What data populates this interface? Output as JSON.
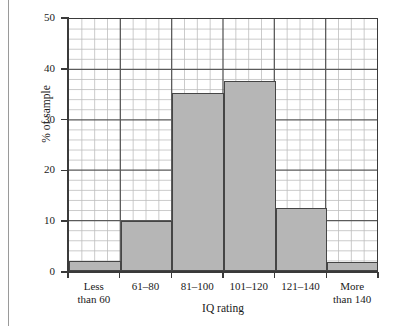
{
  "chart_data": {
    "type": "bar",
    "title": "",
    "subtitle": "",
    "xlabel": "IQ rating",
    "ylabel": "% of sample",
    "categories": [
      "Less\nthan 60",
      "61–80",
      "81–100",
      "101–120",
      "121–140",
      "More\nthan 140"
    ],
    "values": [
      2,
      9.8,
      35,
      37.5,
      12.5,
      1.7
    ],
    "ylim": [
      0,
      50
    ],
    "yticks": [
      0,
      10,
      20,
      30,
      40,
      50
    ],
    "ytick_labels": [
      "0",
      "10",
      "20",
      "30",
      "40",
      "50"
    ],
    "grid": true,
    "grid_minor_y_step": 2,
    "grid_minor_x_per_category": 4,
    "legend": "none",
    "annotations": [],
    "colors": {
      "bar_fill": "#b6b6b6",
      "bar_edge": "#454545",
      "axis": "#3a3a3a",
      "grid_major": "#5a5a5a",
      "grid_minor": "#bdbdbd",
      "text": "#1a1a1a",
      "background": "#ffffff"
    }
  },
  "figure": {
    "ytitle": "% of sample",
    "xtitle": "IQ rating"
  }
}
